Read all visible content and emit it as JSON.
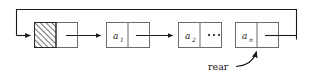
{
  "diagram": {
    "colors": {
      "stroke": "#6b6b6b",
      "dark_stroke": "#1a1a1a",
      "background": "#ffffff",
      "hatch": "#2a2a2a"
    },
    "nodes": [
      {
        "id": "head",
        "label": "",
        "hatched": true,
        "data_field_label": "",
        "pointer_field_label": ""
      },
      {
        "id": "n1",
        "label": "a",
        "subscript": "1",
        "hatched": false
      },
      {
        "id": "n2",
        "label": "a",
        "subscript": "2",
        "hatched": false
      },
      {
        "id": "nn",
        "label": "a",
        "subscript": "n",
        "hatched": false
      }
    ],
    "ellipsis": "···",
    "annotations": [
      {
        "id": "rear",
        "label": "rear",
        "points_to": "nn"
      }
    ],
    "links": [
      {
        "from": "head",
        "to": "n1"
      },
      {
        "from": "n1",
        "to": "n2"
      },
      {
        "from": "n2",
        "to": "ellipsis"
      },
      {
        "from": "nn",
        "to": "head",
        "style": "loop-back-top"
      }
    ]
  }
}
